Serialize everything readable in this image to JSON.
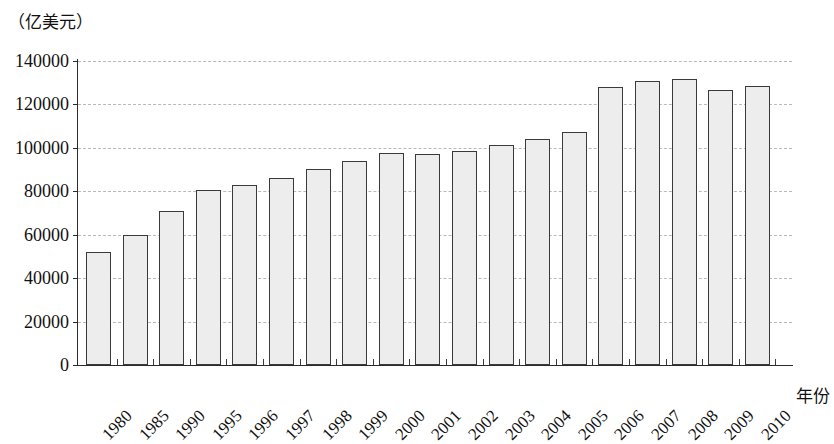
{
  "chart_data": {
    "type": "bar",
    "title": "",
    "subtitle": "",
    "unit_caption": "（亿美元）",
    "xlabel": "年份",
    "ylabel": "",
    "ylim": [
      0,
      140000
    ],
    "ytick_step": 20000,
    "yticks": [
      "140000",
      "120000",
      "100000",
      "80000",
      "60000",
      "40000",
      "20000",
      "0"
    ],
    "ytick_values": [
      140000,
      120000,
      100000,
      80000,
      60000,
      40000,
      20000,
      0
    ],
    "grid": true,
    "grid_style": "dashed-horizontal",
    "legend": "none",
    "categories": [
      "1980",
      "1985",
      "1990",
      "1995",
      "1996",
      "1997",
      "1998",
      "1999",
      "2000",
      "2001",
      "2002",
      "2003",
      "2004",
      "2005",
      "2006",
      "2007",
      "2008",
      "2009",
      "2010"
    ],
    "values": [
      52000,
      60000,
      71000,
      80500,
      83000,
      86000,
      90500,
      94000,
      97500,
      97000,
      98500,
      101500,
      104000,
      107500,
      128000,
      131000,
      131500,
      126500,
      128500
    ],
    "bar_fill_color": "#ededed",
    "bar_edge_color": "#3a3a3a",
    "axis_color": "#2b2b2b",
    "grid_color": "#b9b9b9",
    "background_color": "#ffffff",
    "xtick_label_rotation": -45
  }
}
